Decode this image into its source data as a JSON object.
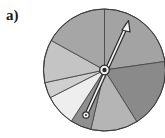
{
  "label": "a)",
  "spinner": {
    "center": [
      104.5,
      70
    ],
    "radius": 61,
    "sectors": [
      {
        "name": "sector-1",
        "from_deg": 0,
        "to_deg": 82,
        "color": "#a3a3a3"
      },
      {
        "name": "sector-2",
        "from_deg": 82,
        "to_deg": 148,
        "color": "#8a8a8a"
      },
      {
        "name": "sector-3",
        "from_deg": 148,
        "to_deg": 193,
        "color": "#b5b5b5"
      },
      {
        "name": "sector-4",
        "from_deg": 193,
        "to_deg": 213,
        "color": "#909090"
      },
      {
        "name": "sector-5",
        "from_deg": 213,
        "to_deg": 243,
        "color": "#eeeeee"
      },
      {
        "name": "sector-6",
        "from_deg": 243,
        "to_deg": 258,
        "color": "#cfcfcf"
      },
      {
        "name": "sector-7",
        "from_deg": 258,
        "to_deg": 299,
        "color": "#c4c4c4"
      },
      {
        "name": "sector-8",
        "from_deg": 299,
        "to_deg": 360,
        "color": "#a6a6a6"
      }
    ],
    "pointer": {
      "tip": [
        128,
        22
      ],
      "tail": [
        86,
        115
      ]
    }
  }
}
